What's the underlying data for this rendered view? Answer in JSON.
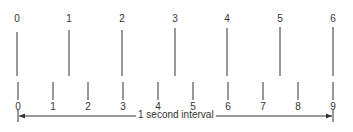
{
  "diagram": {
    "top_row": {
      "labels": [
        "0",
        "1",
        "2",
        "3",
        "4",
        "5",
        "6"
      ],
      "x": [
        17,
        69,
        122,
        175,
        227,
        280,
        333
      ],
      "line_top": [
        32,
        30,
        30,
        28,
        28,
        27,
        27
      ],
      "line_bottom": 76
    },
    "bottom_row": {
      "labels": [
        "0",
        "1",
        "2",
        "3",
        "4",
        "5",
        "6",
        "7",
        "8",
        "9"
      ],
      "x": [
        18,
        53,
        88,
        123,
        158,
        193,
        228,
        263,
        298,
        333
      ],
      "line_top": 82,
      "line_bottom": 100
    },
    "interval": {
      "label": "1 second interval",
      "x_start": 18,
      "x_end": 333,
      "y": 116
    },
    "stroke_color": "#333333"
  }
}
